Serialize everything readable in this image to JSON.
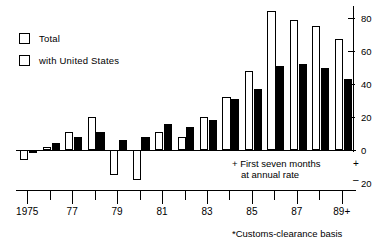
{
  "chart_data": {
    "type": "bar",
    "title": "",
    "subtitle": "",
    "xlabel": "",
    "ylabel": "",
    "ylim": [
      -20,
      85
    ],
    "grid": false,
    "legend_position": "top-left",
    "categories": [
      "1975",
      "76",
      "77",
      "78",
      "79",
      "80",
      "81",
      "82",
      "83",
      "84",
      "85",
      "86",
      "87",
      "88",
      "89+"
    ],
    "tick_labels": [
      "1975",
      "77",
      "79",
      "81",
      "83",
      "85",
      "87",
      "89+"
    ],
    "tick_label_indices": [
      0,
      2,
      4,
      6,
      8,
      10,
      12,
      14
    ],
    "y_ticks": [
      0,
      20,
      40,
      60,
      80
    ],
    "y_tick_labels": [
      "0",
      "20",
      "40",
      "60",
      "80"
    ],
    "negative_axis_label": "20",
    "plus_sign": "+",
    "minus_sign": "–",
    "series": [
      {
        "name": "Total",
        "style": "outlined",
        "color": "#ffffff",
        "values": [
          -6,
          2,
          11,
          20,
          -15,
          -18,
          11,
          8,
          20,
          32,
          48,
          84,
          79,
          75,
          67
        ]
      },
      {
        "name": "with United States",
        "style": "filled",
        "color": "#000000",
        "values": [
          -2,
          4,
          8,
          11,
          6,
          8,
          16,
          14,
          18,
          31,
          37,
          51,
          52,
          50,
          43
        ]
      }
    ],
    "annotations": [
      {
        "name": "first-seven-months-note",
        "line1": "+  First  seven  months",
        "line2": "at  annual  rate"
      },
      {
        "name": "customs-clearance-footnote",
        "text": "*Customs-clearance  basis"
      }
    ]
  },
  "legend": {
    "items": [
      {
        "label": "Total",
        "swatch": "outlined-square-icon"
      },
      {
        "label": "with  United  States",
        "swatch": "outlined-square-icon"
      }
    ]
  }
}
